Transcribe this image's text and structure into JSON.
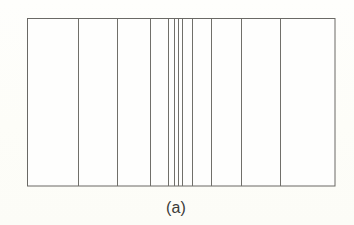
{
  "figure": {
    "caption": "(a)",
    "caption_x": 176,
    "caption_y": 199,
    "background_color": "#fdfdf9",
    "panel_fill": "#fefefd",
    "line_color": "#706f6a",
    "border_color": "#6a6965",
    "line_width": 1,
    "frame": {
      "x": 26.5,
      "y": 17.5,
      "width": 307.5,
      "height": 167.5,
      "right": 334,
      "bottom": 185
    }
  },
  "chart_data": {
    "type": "bar",
    "title": "(a)",
    "subtitle": "",
    "xlabel": "",
    "ylabel": "",
    "orientation": "vertical-partition",
    "grid": false,
    "legend": null,
    "xlim": [
      26.5,
      334
    ],
    "ylim": [
      17.5,
      185
    ],
    "axis_ticks_shown": false,
    "frame_left": 26.5,
    "frame_right": 334,
    "frame_top": 17.5,
    "frame_bottom": 185,
    "divider_positions": [
      77.3,
      116.5,
      149.3,
      167.0,
      173.0,
      177.0,
      181.3,
      191.0,
      210.7,
      240.7,
      279.3
    ],
    "band_edges": [
      26.5,
      77.3,
      116.5,
      149.3,
      167.0,
      173.0,
      177.0,
      181.3,
      191.0,
      210.7,
      240.7,
      279.3,
      334.0
    ],
    "band_widths": [
      50.8,
      39.2,
      32.8,
      17.7,
      6.0,
      4.0,
      4.3,
      9.7,
      19.7,
      30.0,
      38.6,
      54.7
    ],
    "band_count": 12,
    "divider_count": 11
  }
}
